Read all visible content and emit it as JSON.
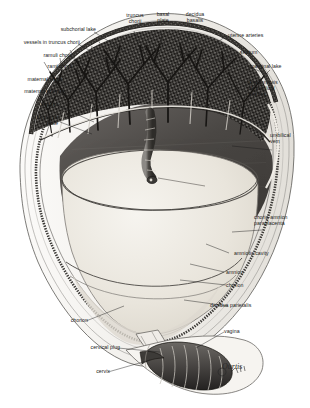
{
  "figure": {
    "medium": "pen-and-ink anatomical illustration, grayscale halftone",
    "signature": "Ourtis",
    "top_cut_text": "",
    "colors": {
      "paper": "#ffffff",
      "ink": "#1a1a1a",
      "amniotic_cavity_fill": "#ebe7df",
      "intervillous_space": "#4d4a47",
      "decidua_dark": "#2b2926",
      "myometrium_light": "#f2f1ee",
      "cord_gray": "#5f5c58"
    }
  },
  "labels": {
    "top": [
      {
        "id": "truncus-chorii",
        "text": "truncus\nchorii"
      },
      {
        "id": "basal-plate",
        "text": "basal\nplate"
      },
      {
        "id": "decidua-basalis",
        "text": "decidua\nbasalis"
      }
    ],
    "left": [
      {
        "id": "subchorial-lake",
        "text": "subchorial lake"
      },
      {
        "id": "vessels-in-truncus-chorii",
        "text": "vessels in truncus chorii"
      },
      {
        "id": "ramuli-chorii",
        "text": "ramuli chorii"
      },
      {
        "id": "rami-chorii",
        "text": "rami chorii"
      },
      {
        "id": "maternal-veins",
        "text": "maternal veins"
      },
      {
        "id": "maternal-arteries",
        "text": "maternal arteries"
      },
      {
        "id": "septum",
        "text": "septum"
      },
      {
        "id": "chorionic-plate",
        "text": "chorionic\nplate"
      },
      {
        "id": "chorion-left",
        "text": "chorion"
      },
      {
        "id": "cervical-plug",
        "text": "cervical plug"
      },
      {
        "id": "cervix",
        "text": "cervix"
      }
    ],
    "right": [
      {
        "id": "uterine-arteries",
        "text": "uterine arteries"
      },
      {
        "id": "septum-right",
        "text": "septum"
      },
      {
        "id": "marginal-lake",
        "text": "marginal lake"
      },
      {
        "id": "anastomosis-umbilical-arteries",
        "text": "anastomosis\nof umbilical\narteries"
      },
      {
        "id": "umbilical-vein",
        "text": "umbilical\nvein"
      },
      {
        "id": "chorio-amnion-paraplacenta",
        "text": "chorio-amnion\nparaplacenta"
      },
      {
        "id": "amniotic-cavity",
        "text": "amniotic cavity"
      },
      {
        "id": "amnion",
        "text": "amnion"
      },
      {
        "id": "chorion-right",
        "text": "chorion"
      },
      {
        "id": "decidua-parietalis",
        "text": "decidua parietalis"
      },
      {
        "id": "vagina",
        "text": "vagina"
      }
    ]
  }
}
